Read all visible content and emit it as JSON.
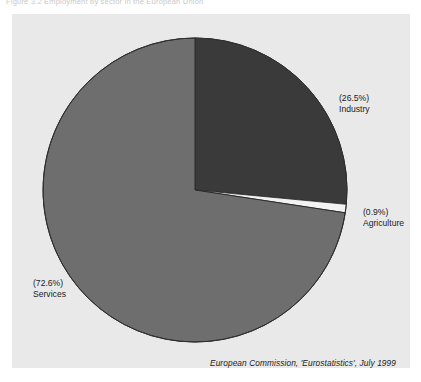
{
  "figure": {
    "top_caption": "Figure 3.2  Employment by sector in the European Union"
  },
  "colors": {
    "panel_background": "#e9e9e9",
    "industry": "#3a3a3a",
    "agriculture": "#f2f2f2",
    "services": "#6e6e6e",
    "outline": "#2a2a2a",
    "text": "#1b1b1b"
  },
  "labels": {
    "industry": {
      "pct": "(26.5%)",
      "name": "Industry"
    },
    "agriculture": {
      "pct": "(0.9%)",
      "name": "Agriculture"
    },
    "services": {
      "pct": "(72.6%)",
      "name": "Services"
    }
  },
  "source": {
    "text": "European Commission, 'Eurostatistics', July 1999"
  },
  "chart_data": {
    "type": "pie",
    "title": "",
    "subtitle": "",
    "xlabel": "",
    "ylabel": "",
    "categories": [
      "Industry",
      "Agriculture",
      "Services"
    ],
    "values": [
      26.5,
      0.9,
      72.6
    ],
    "value_unit": "%",
    "labels": [
      "(26.5%) Industry",
      "(0.9%) Agriculture",
      "(72.6%) Services"
    ],
    "colors": [
      "#3a3a3a",
      "#f2f2f2",
      "#6e6e6e"
    ],
    "start_angle_deg": 0,
    "direction": "clockwise",
    "legend": "none",
    "grid": false,
    "annotations": [
      "European Commission, 'Eurostatistics', July 1999"
    ]
  }
}
